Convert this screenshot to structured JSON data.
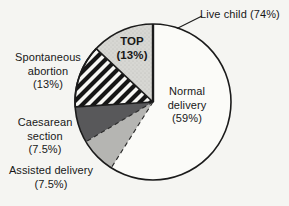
{
  "figure": {
    "background": "#f5f5f2",
    "line_color": "#1b1b1b",
    "text_color": "#181818",
    "dash_color": "#2b2b2b"
  },
  "chart_data": {
    "type": "pie",
    "title": "",
    "start_angle_deg": 0,
    "direction": "clockwise",
    "legend_position": "none",
    "slices": [
      {
        "id": "normal-delivery",
        "label": "Normal delivery",
        "value": 59,
        "unit": "%",
        "fill": "#fbfbf8",
        "start_edge": "bold"
      },
      {
        "id": "assisted-delivery",
        "label": "Assisted delivery",
        "value": 7.5,
        "unit": "%",
        "fill": "#b5b5b2",
        "start_edge": "dashed"
      },
      {
        "id": "caesarean-section",
        "label": "Caesarean section",
        "value": 7.5,
        "unit": "%",
        "fill": "#58585a",
        "start_edge": "dashed"
      },
      {
        "id": "spontaneous-abortion",
        "label": "Spontaneous abortion",
        "value": 13,
        "unit": "%",
        "pattern": "diagonal-hatch",
        "outline": true
      },
      {
        "id": "top",
        "label": "TOP",
        "value": 13,
        "unit": "%",
        "pattern": "stipple"
      }
    ],
    "aggregate_annotation": {
      "label": "Live child",
      "value": 74,
      "unit": "%",
      "includes": [
        "Normal delivery",
        "Assisted delivery",
        "Caesarean section"
      ],
      "note": "dashed dividers separate the live-child sub-slices"
    }
  },
  "labels": {
    "live_child": {
      "text": "Live child (74%)"
    },
    "top": {
      "line1": "TOP",
      "line2": "(13%)"
    },
    "normal": {
      "line1": "Normal",
      "line2": "delivery",
      "line3": "(59%)"
    },
    "spontaneous": {
      "line1": "Spontaneous",
      "line2": "abortion",
      "line3": "(13%)"
    },
    "caesarean": {
      "line1": "Caesarean",
      "line2": "section",
      "line3": "(7.5%)"
    },
    "assisted": {
      "line1": "Assisted delivery",
      "line2": "(7.5%)"
    }
  }
}
